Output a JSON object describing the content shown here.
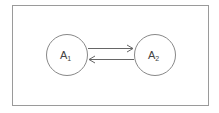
{
  "diagram": {
    "nodes": [
      {
        "id": "A1",
        "base": "A",
        "subscript": "1"
      },
      {
        "id": "A2",
        "base": "A",
        "subscript": "2"
      }
    ],
    "edges": [
      {
        "from": "A1",
        "to": "A2"
      },
      {
        "from": "A2",
        "to": "A1"
      }
    ],
    "colors": {
      "stroke": "#777777",
      "border": "#999999",
      "text": "#444444"
    }
  }
}
